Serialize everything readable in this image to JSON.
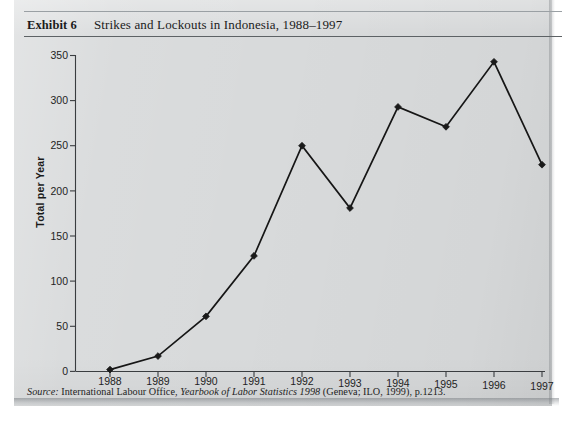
{
  "page": {
    "background_color": "#d8dadb",
    "paper_color": "#ffffff"
  },
  "header": {
    "exhibit_label": "Exhibit 6",
    "title": "Strikes and Lockouts in Indonesia, 1988–1997"
  },
  "source": {
    "prefix": "Source:",
    "publisher": "International Labour Office,",
    "work": "Yearbook of Labor Statistics 1998",
    "imprint": "(Geneva; ILO, 1999), p.1213."
  },
  "chart_data": {
    "type": "line",
    "title": "Strikes and Lockouts in Indonesia, 1988–1997",
    "xlabel": "",
    "ylabel": "Total per Year",
    "categories": [
      "1988",
      "1989",
      "1990",
      "1991",
      "1992",
      "1993",
      "1994",
      "1995",
      "1996",
      "1997"
    ],
    "values": [
      2,
      17,
      61,
      128,
      250,
      181,
      293,
      271,
      343,
      229
    ],
    "ylim": [
      0,
      350
    ],
    "yticks": [
      0,
      50,
      100,
      150,
      200,
      250,
      300,
      350
    ],
    "ytick_labels": [
      "0",
      "50",
      "100",
      "150",
      "200",
      "250",
      "300",
      "350"
    ],
    "xtick_labels": [
      "1988",
      "1989",
      "1990",
      "1991",
      "1992",
      "1993",
      "1994",
      "1995",
      "1996",
      "1997"
    ],
    "grid": false,
    "legend": null,
    "series": [
      {
        "name": "Total per Year",
        "color": "#1a1a1a",
        "marker": "diamond",
        "values": [
          2,
          17,
          61,
          128,
          250,
          181,
          293,
          271,
          343,
          229
        ]
      }
    ]
  }
}
